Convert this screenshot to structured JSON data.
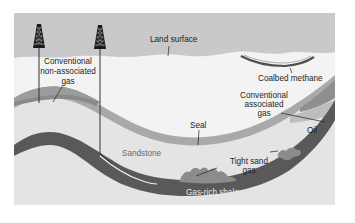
{
  "diagram": {
    "labels": {
      "land_surface": "Land surface",
      "coalbed_methane": "Coalbed methane",
      "conventional_non_associated_gas": [
        "Conventional",
        "non-associated",
        "gas"
      ],
      "conventional_associated_gas": [
        "Conventional",
        "associated",
        "gas"
      ],
      "oil": "Oil",
      "seal": "Seal",
      "sandstone": "Sandstone",
      "tight_sand_gas": [
        "Tight sand",
        "gas"
      ],
      "gas_rich_shale": "Gas-rich shale"
    },
    "wells": [
      {
        "name": "vertical-well",
        "type": "vertical"
      },
      {
        "name": "horizontal-well",
        "type": "horizontal into shale"
      }
    ],
    "colors": {
      "sky": "#c9c9c9",
      "ground": "#f4f4f4",
      "seal_layer": "#a6a6a6",
      "sandstone": "#e2e2e2",
      "shale": "#5a5a5a",
      "gas_pocket": "#8e8e8e",
      "conventional_gas": "#8a8a8a",
      "coal_seam": "#555555",
      "rig": "#1a1a1a",
      "text": "#1f1f1f"
    }
  }
}
